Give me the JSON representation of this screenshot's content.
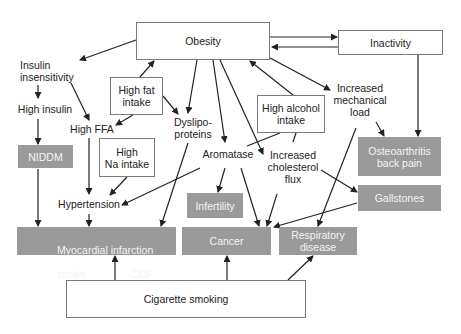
{
  "diagram": {
    "colors": {
      "outcome_fill": "#9a9a9a",
      "outcome_text": "#f4f4f4",
      "box_border": "#7a7a7a",
      "arrow": "#222222"
    },
    "nodes": {
      "obesity": "Obesity",
      "inactivity": "Inactivity",
      "insulin_insensitivity": "Insulin\ninsensitivity",
      "high_insulin": "High insulin",
      "high_fat_intake": "High fat\nintake",
      "dyslipoproteins": "Dyslipo-\nproteins",
      "high_ffa": "High FFA",
      "high_na_intake": "High\nNa intake",
      "niddm": "NIDDM",
      "aromatase": "Aromatase",
      "high_alcohol_intake": "High alcohol\nintake",
      "increased_mechanical_load": "Increased\nmechanical\nload",
      "increased_cholesterol_flux": "Increased\ncholesterol\nflux",
      "osteoarthritis": "Osteoarthritis\nback pain",
      "gallstones": "Gallstones",
      "hypertension": "Hypertension",
      "infertility": "Infertility",
      "mi_line1": "Myocardial infarction",
      "mi_stroke": "stroke",
      "mi_ccf": "CCF",
      "cancer": "Cancer",
      "respiratory": "Respiratory\ndisease",
      "cigarette_smoking": "Cigarette smoking"
    },
    "edges": [
      [
        "obesity",
        "inactivity"
      ],
      [
        "inactivity",
        "obesity"
      ],
      [
        "obesity",
        "insulin_insensitivity"
      ],
      [
        "insulin_insensitivity",
        "high_insulin"
      ],
      [
        "insulin_insensitivity",
        "high_ffa"
      ],
      [
        "high_insulin",
        "niddm"
      ],
      [
        "niddm",
        "myocardial_infarction"
      ],
      [
        "high_fat_intake",
        "obesity"
      ],
      [
        "high_fat_intake",
        "dyslipoproteins"
      ],
      [
        "high_fat_intake",
        "high_ffa"
      ],
      [
        "obesity",
        "dyslipoproteins"
      ],
      [
        "obesity",
        "aromatase"
      ],
      [
        "obesity",
        "increased_cholesterol_flux"
      ],
      [
        "obesity",
        "increased_mechanical_load"
      ],
      [
        "high_alcohol_intake",
        "obesity"
      ],
      [
        "high_alcohol_intake",
        "aromatase"
      ],
      [
        "high_alcohol_intake",
        "increased_cholesterol_flux"
      ],
      [
        "high_ffa",
        "hypertension"
      ],
      [
        "high_na_intake",
        "hypertension"
      ],
      [
        "aromatase",
        "hypertension"
      ],
      [
        "hypertension",
        "myocardial_infarction"
      ],
      [
        "dyslipoproteins",
        "myocardial_infarction"
      ],
      [
        "aromatase",
        "infertility"
      ],
      [
        "aromatase",
        "cancer"
      ],
      [
        "increased_cholesterol_flux",
        "cancer"
      ],
      [
        "increased_cholesterol_flux",
        "gallstones"
      ],
      [
        "gallstones",
        "cancer"
      ],
      [
        "increased_mechanical_load",
        "osteoarthritis"
      ],
      [
        "increased_mechanical_load",
        "respiratory"
      ],
      [
        "inactivity",
        "osteoarthritis"
      ],
      [
        "cigarette_smoking",
        "myocardial_infarction"
      ],
      [
        "cigarette_smoking",
        "cancer"
      ],
      [
        "cigarette_smoking",
        "respiratory"
      ]
    ]
  }
}
